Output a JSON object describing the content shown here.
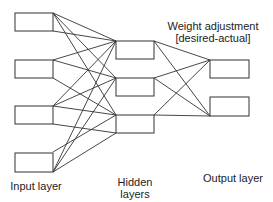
{
  "title": {
    "line1": "Weight adjustment",
    "line2": "[desired-actual]"
  },
  "labels": {
    "input": "Input layer",
    "hidden_line1": "Hidden",
    "hidden_line2": "layers",
    "output": "Output layer"
  },
  "layers": {
    "input": {
      "count": 4
    },
    "hidden": {
      "count": 3
    },
    "output": {
      "count": 2
    }
  },
  "colors": {
    "stroke": "#333333",
    "background": "#ffffff"
  }
}
